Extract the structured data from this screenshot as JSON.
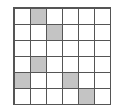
{
  "grid": {
    "rows": 6,
    "cols": 6,
    "line_color": "#555555",
    "fill_color": "#c4c4c4",
    "shaded_cells": [
      [
        0,
        1
      ],
      [
        1,
        2
      ],
      [
        3,
        1
      ],
      [
        4,
        0
      ],
      [
        4,
        3
      ],
      [
        5,
        4
      ]
    ]
  }
}
